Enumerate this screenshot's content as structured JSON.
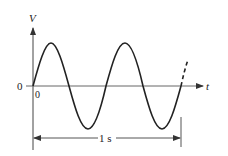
{
  "diagram": {
    "type": "sine-wave-period",
    "y_axis_label": "V",
    "x_axis_label": "t",
    "origin_y_label": "0",
    "origin_x_label": "0",
    "dimension_label": "1 s",
    "cycles_shown": 2.5,
    "line_color": "#222222",
    "axis_color": "#555555"
  }
}
